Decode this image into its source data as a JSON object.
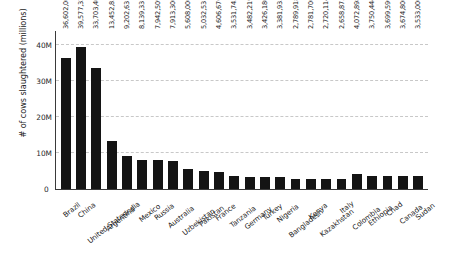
{
  "chart_data": {
    "type": "bar",
    "title": "",
    "subtitle": "",
    "xlabel": "",
    "ylabel": "# of cows slaughtered (millions)",
    "ylim": [
      0,
      44000000
    ],
    "grid": true,
    "legend": null,
    "orientation": "vertical",
    "bar_color": "#141414",
    "ytick_labels": [
      "0",
      "10M",
      "20M",
      "30M",
      "40M"
    ],
    "ytick_values": [
      0,
      10000000,
      20000000,
      30000000,
      40000000
    ],
    "categories": [
      "Brazil",
      "China",
      "United States",
      "Argentina",
      "India",
      "Mexico",
      "Russia",
      "Australia",
      "Uzbekistan",
      "Pakistan",
      "France",
      "Tanzania",
      "Germany",
      "Turkey",
      "Nigeria",
      "Bangladesh",
      "Kenya",
      "Kazakhstan",
      "Italy",
      "Colombia",
      "Ethiopia",
      "Chad",
      "Canada",
      "Sudan"
    ],
    "values": [
      36602000,
      39577320,
      33703400,
      13452831,
      9202631,
      8139331,
      7942509,
      7913300,
      5608000,
      5032531,
      4606676,
      3531743,
      3482219,
      3426180,
      3381933,
      2789918,
      2781700,
      2720114,
      2658875,
      4072898,
      3750444,
      3699596,
      3674800,
      3533000
    ],
    "value_labels": [
      "36,602,000",
      "39,577,320",
      "33,703,400",
      "13,452,831",
      "9,202,631",
      "8,139,331",
      "7,942,509",
      "7,913,300",
      "5,608,000",
      "5,032,531",
      "4,606,676",
      "3,531,743",
      "3,482,219",
      "3,426,180",
      "3,381,933",
      "2,789,918",
      "2,781,700",
      "2,720,114",
      "2,658,875",
      "4,072,898",
      "3,750,444",
      "3,699,596",
      "3,674,800",
      "3,533,000"
    ],
    "axis_origin_label": "0"
  }
}
